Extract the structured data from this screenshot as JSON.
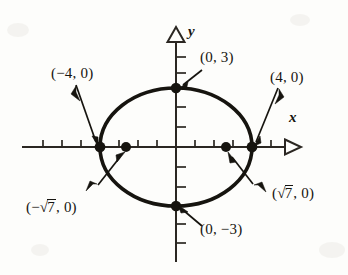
{
  "figure": {
    "type": "ellipse-graph",
    "caption_text": "",
    "axes": {
      "x_label": "x",
      "y_label": "y",
      "x_arrow": "open-triangle-right",
      "y_arrow": "open-triangle-up",
      "origin_px": [
        176,
        147
      ],
      "x_tick_spacing_px": 19,
      "y_tick_spacing_px": 20,
      "x_tick_count_left": 6,
      "x_tick_count_right": 6,
      "y_tick_count_up": 5,
      "y_tick_count_down": 5
    },
    "ellipse": {
      "center_px": [
        176,
        147
      ],
      "semi_major_px": 76,
      "semi_minor_px": 59,
      "a": 4,
      "b": 3,
      "c": 2.6457513,
      "stroke": "#16140f",
      "stroke_width": 3.4
    },
    "points": [
      {
        "id": "top-vertex",
        "label": "(0, 3)",
        "x_px": 176,
        "y_px": 88,
        "filled": true
      },
      {
        "id": "bottom-vertex",
        "label": "(0, −3)",
        "x_px": 176,
        "y_px": 206,
        "filled": true
      },
      {
        "id": "left-vertex",
        "label": "(−4, 0)",
        "x_px": 100,
        "y_px": 147,
        "filled": true
      },
      {
        "id": "right-vertex",
        "label": "(4, 0)",
        "x_px": 252,
        "y_px": 147,
        "filled": true
      },
      {
        "id": "left-focus",
        "label": "(−√7, 0)",
        "x_px": 126,
        "y_px": 147,
        "filled": true
      },
      {
        "id": "right-focus",
        "label": "(√7, 0)",
        "x_px": 226,
        "y_px": 147,
        "filled": true
      }
    ],
    "labels": {
      "top_vertex": "(0, 3)",
      "bottom_vertex": "(0, −3)",
      "left_vertex": "(−4, 0)",
      "right_vertex": "(4, 0)",
      "left_focus_open": "(−",
      "left_focus_radicand": "7",
      "left_focus_close": ", 0)",
      "right_focus_open": "(",
      "right_focus_radicand": "7",
      "right_focus_close": ", 0)",
      "radical_symbol": "√"
    },
    "colors": {
      "ink": "#16140f",
      "paper": "#fdfdfb",
      "axis": "#2b2722"
    }
  }
}
